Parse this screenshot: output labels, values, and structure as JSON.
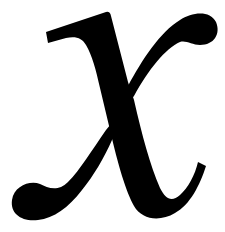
{
  "image": {
    "description": "Italic mathematical variable glyph",
    "character": "x",
    "ink_color": "#000000",
    "background_color": "#ffffff"
  }
}
